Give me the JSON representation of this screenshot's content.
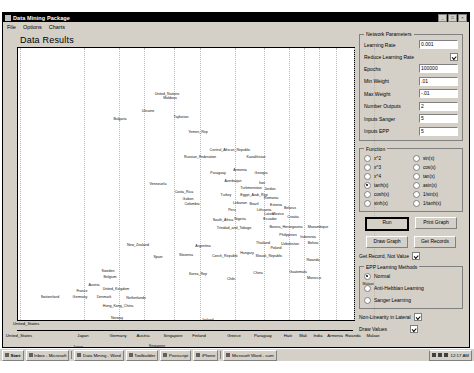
{
  "window": {
    "title": "Data Mining Package",
    "buttons": [
      "_",
      "□",
      "×"
    ],
    "menu": [
      "File",
      "Options",
      "Charts"
    ],
    "page_title": "Data Results"
  },
  "network_parameters": {
    "legend": "Network Parameters",
    "fields": [
      {
        "label": "Learning Rate",
        "value": "0.001"
      },
      {
        "label": "Epochs",
        "value": "100000"
      },
      {
        "label": "Min Weight",
        "value": ".01"
      },
      {
        "label": "Max Weight",
        "value": "-.01"
      },
      {
        "label": "Number Outputs",
        "value": "2"
      },
      {
        "label": "Inputs Sanger",
        "value": "5"
      },
      {
        "label": "Inputs EPP",
        "value": "5"
      }
    ],
    "reduce_learning_rate": {
      "label": "Reduce Learning Rate",
      "checked": true
    }
  },
  "function": {
    "legend": "Function",
    "selected": "tanh(x)",
    "options_left": [
      "x^2",
      "x^3",
      "x^4",
      "tanh(x)",
      "cosh(x)",
      "sinh(x)"
    ],
    "options_right": [
      "sin(x)",
      "cos(x)",
      "tan(x)",
      "asin(x)",
      "1/sin(x)",
      "1/tanh(x)"
    ]
  },
  "actions": {
    "run": "Run",
    "print_graph": "Print Graph",
    "draw_graph": "Draw Graph",
    "get_records": "Get Records"
  },
  "checkboxes": {
    "get_record_not_value": {
      "label": "Get Record, Not Value",
      "checked": true
    },
    "non_linearity_in_lateral": {
      "label": "Non-Linearity in Lateral",
      "checked": true
    },
    "draw_values": {
      "label": "Draw Values",
      "checked": true
    }
  },
  "epp_learning": {
    "legend": "EPP Learning Methods",
    "selected": "Normal",
    "options": [
      "Normal",
      "Anti-Hebbian Learning",
      "Sanger Learning"
    ]
  },
  "chart_data": {
    "type": "scatter",
    "title": "Data Results",
    "xlabel": "",
    "ylabel": "",
    "grid": true,
    "origin_label": "United_States",
    "xtick_labels": [
      "United_States",
      "Japan",
      "Germany",
      "Austria",
      "Singapore",
      "Finland",
      "Greece",
      "Paraguay",
      "Haiti",
      "Mali",
      "India",
      "Armenia",
      "Rwanda",
      "Malawi"
    ],
    "xtick_positions": [
      6,
      70,
      105,
      130,
      160,
      186,
      221,
      250,
      275,
      290,
      305,
      322,
      340,
      360
    ],
    "points": [
      {
        "label": "United_Nations",
        "x": 149,
        "y": 47
      },
      {
        "label": "Moldova",
        "x": 152,
        "y": 51
      },
      {
        "label": "Ukraine",
        "x": 130,
        "y": 64
      },
      {
        "label": "Tajikistan",
        "x": 163,
        "y": 70
      },
      {
        "label": "Bulgaria",
        "x": 102,
        "y": 72
      },
      {
        "label": "Yemen_Rep",
        "x": 180,
        "y": 85
      },
      {
        "label": "Central_African_Republic",
        "x": 212,
        "y": 103
      },
      {
        "label": "Russian_Federation",
        "x": 182,
        "y": 110
      },
      {
        "label": "Kazakhstan",
        "x": 238,
        "y": 110
      },
      {
        "label": "Venezuela",
        "x": 140,
        "y": 137
      },
      {
        "label": "Paraguay",
        "x": 200,
        "y": 126
      },
      {
        "label": "Armenia",
        "x": 222,
        "y": 123
      },
      {
        "label": "Georgia",
        "x": 243,
        "y": 126
      },
      {
        "label": "Costa_Rica",
        "x": 166,
        "y": 145
      },
      {
        "label": "Azerbaijan",
        "x": 215,
        "y": 134
      },
      {
        "label": "Turkmenistan",
        "x": 233,
        "y": 141
      },
      {
        "label": "Egypt_Arab_Rep",
        "x": 236,
        "y": 148
      },
      {
        "label": "Gabon",
        "x": 170,
        "y": 152
      },
      {
        "label": "Colombia",
        "x": 174,
        "y": 157
      },
      {
        "label": "Lebanon",
        "x": 222,
        "y": 156
      },
      {
        "label": "Romania",
        "x": 253,
        "y": 151
      },
      {
        "label": "Estonia",
        "x": 258,
        "y": 158
      },
      {
        "label": "Lithuania",
        "x": 246,
        "y": 163
      },
      {
        "label": "Latvia",
        "x": 251,
        "y": 167
      },
      {
        "label": "Belarus",
        "x": 272,
        "y": 161
      },
      {
        "label": "South_Africa",
        "x": 205,
        "y": 173
      },
      {
        "label": "Nigeria",
        "x": 222,
        "y": 172
      },
      {
        "label": "Ecuador",
        "x": 252,
        "y": 172
      },
      {
        "label": "Croatia",
        "x": 275,
        "y": 170
      },
      {
        "label": "Trinidad_and_Tobago",
        "x": 216,
        "y": 181
      },
      {
        "label": "Bosnia_Herzegovina",
        "x": 268,
        "y": 180
      },
      {
        "label": "Mozambique",
        "x": 300,
        "y": 180
      },
      {
        "label": "Philippines",
        "x": 270,
        "y": 188
      },
      {
        "label": "Indonesia",
        "x": 290,
        "y": 190
      },
      {
        "label": "Thailand",
        "x": 245,
        "y": 196
      },
      {
        "label": "Uzbekistan",
        "x": 272,
        "y": 197
      },
      {
        "label": "Bolivia",
        "x": 295,
        "y": 196
      },
      {
        "label": "Argentina",
        "x": 185,
        "y": 199
      },
      {
        "label": "Poland",
        "x": 258,
        "y": 201
      },
      {
        "label": "Slovenia",
        "x": 168,
        "y": 208
      },
      {
        "label": "Czech_Republic",
        "x": 207,
        "y": 209
      },
      {
        "label": "Slovak_Republic",
        "x": 251,
        "y": 209
      },
      {
        "label": "Hungary",
        "x": 229,
        "y": 206
      },
      {
        "label": "New_Zealand",
        "x": 120,
        "y": 198
      },
      {
        "label": "Spain",
        "x": 140,
        "y": 210
      },
      {
        "label": "Korea_Rep",
        "x": 180,
        "y": 227
      },
      {
        "label": "China",
        "x": 240,
        "y": 226
      },
      {
        "label": "Chile",
        "x": 213,
        "y": 232
      },
      {
        "label": "Sweden",
        "x": 90,
        "y": 224
      },
      {
        "label": "Belgium",
        "x": 92,
        "y": 230
      },
      {
        "label": "Austria",
        "x": 76,
        "y": 238
      },
      {
        "label": "France",
        "x": 64,
        "y": 244
      },
      {
        "label": "United_Kingdom",
        "x": 98,
        "y": 242
      },
      {
        "label": "Germany",
        "x": 62,
        "y": 250
      },
      {
        "label": "Denmark",
        "x": 86,
        "y": 250
      },
      {
        "label": "Netherlands",
        "x": 118,
        "y": 251
      },
      {
        "label": "Hong_Kong_China",
        "x": 100,
        "y": 259
      },
      {
        "label": "Norway",
        "x": 99,
        "y": 271
      },
      {
        "label": "Switzerland",
        "x": 32,
        "y": 250
      },
      {
        "label": "Japan",
        "x": 60,
        "y": 300
      },
      {
        "label": "Singapore",
        "x": 139,
        "y": 299
      },
      {
        "label": "Ireland",
        "x": 190,
        "y": 273
      },
      {
        "label": "Rwanda",
        "x": 295,
        "y": 213
      },
      {
        "label": "Guatemala",
        "x": 280,
        "y": 225
      },
      {
        "label": "Morocco",
        "x": 296,
        "y": 231
      },
      {
        "label": "Malawi",
        "x": 350,
        "y": 237
      },
      {
        "label": "Mexico",
        "x": 260,
        "y": 167
      },
      {
        "label": "Turkey",
        "x": 208,
        "y": 148
      },
      {
        "label": "Peru",
        "x": 214,
        "y": 163
      },
      {
        "label": "Brazil",
        "x": 236,
        "y": 157
      },
      {
        "label": "Iran",
        "x": 244,
        "y": 136
      },
      {
        "label": "Jordan",
        "x": 252,
        "y": 142
      }
    ]
  },
  "taskbar": {
    "start": "Start",
    "items": [
      "Inbox - Microsoft",
      "Data Mining - Word",
      "Toolbuilder",
      "Postscript",
      "iPhone",
      "Microsoft Word - sum"
    ],
    "clock": "12:17 AM"
  }
}
